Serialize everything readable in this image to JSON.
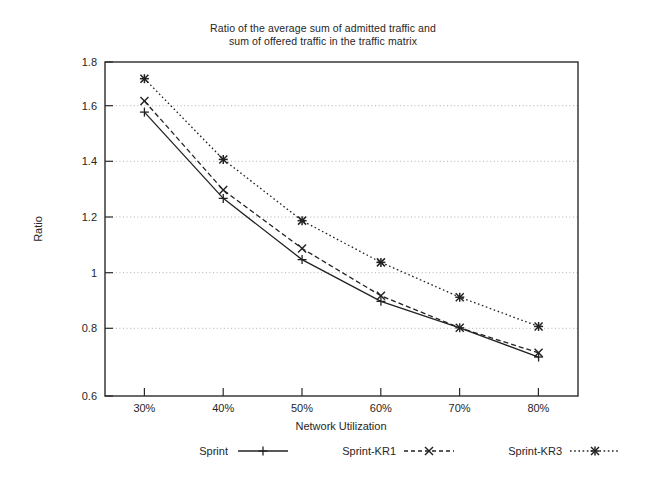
{
  "chart_data": {
    "type": "line",
    "title": "Ratio of the average sum of admitted traffic and sum of offered traffic in the traffic matrix",
    "title_line1": "Ratio of the average sum of admitted traffic and",
    "title_line2": "sum of offered traffic in the traffic matrix",
    "xlabel": "Network Utilization",
    "ylabel": "Ratio",
    "categories": [
      "30%",
      "40%",
      "50%",
      "60%",
      "70%",
      "80%"
    ],
    "x": [
      30,
      40,
      50,
      60,
      70,
      80
    ],
    "xlim": [
      25,
      85
    ],
    "ylim": [
      0.6,
      1.8
    ],
    "ytick_labels": [
      "0.6",
      "0.8",
      "1",
      "1.2",
      "1.4",
      "1.6",
      "1.8"
    ],
    "yticks": [
      0.6,
      0.8,
      1.0,
      1.2,
      1.4,
      1.6,
      1.8
    ],
    "grid": "horizontal-dotted",
    "legend_position": "bottom",
    "series": [
      {
        "name": "Sprint",
        "marker": "plus",
        "line_style": "solid",
        "color": "#222222",
        "values": [
          1.62,
          1.31,
          1.09,
          0.94,
          0.845,
          0.74
        ]
      },
      {
        "name": "Sprint-KR1",
        "marker": "cross",
        "line_style": "dashed",
        "color": "#222222",
        "values": [
          1.66,
          1.34,
          1.13,
          0.96,
          0.845,
          0.755
        ]
      },
      {
        "name": "Sprint-KR3",
        "marker": "asterisk-box",
        "line_style": "dotted",
        "color": "#222222",
        "values": [
          1.74,
          1.45,
          1.23,
          1.08,
          0.955,
          0.85
        ]
      }
    ]
  },
  "legend": {
    "items": [
      {
        "label": "Sprint"
      },
      {
        "label": "Sprint-KR1"
      },
      {
        "label": "Sprint-KR3"
      }
    ]
  }
}
